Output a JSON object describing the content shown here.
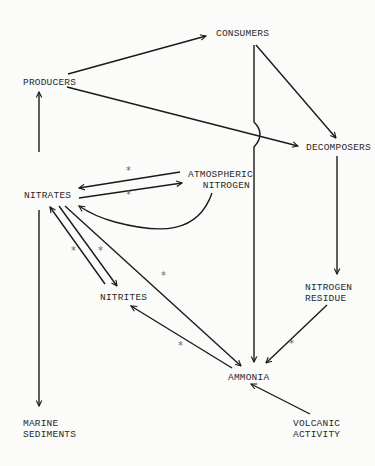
{
  "diagram": {
    "nodes": {
      "producers": "PRODUCERS",
      "consumers": "CONSUMERS",
      "decomposers": "DECOMPOSERS",
      "nitrates": "NITRATES",
      "atmospheric_nitrogen_line1": "ATMOSPHERIC",
      "atmospheric_nitrogen_line2": "NITROGEN",
      "nitrites": "NITRITES",
      "nitrogen_residue_line1": "NITROGEN",
      "nitrogen_residue_line2": "RESIDUE",
      "ammonia": "AMMONIA",
      "marine_sediments_line1": "MARINE",
      "marine_sediments_line2": "SEDIMENTS",
      "volcanic_activity_line1": "VOLCANIC",
      "volcanic_activity_line2": "ACTIVITY"
    },
    "marker": "*",
    "edges": [
      {
        "from": "PRODUCERS",
        "to": "CONSUMERS"
      },
      {
        "from": "PRODUCERS",
        "to": "DECOMPOSERS"
      },
      {
        "from": "CONSUMERS",
        "to": "DECOMPOSERS"
      },
      {
        "from": "CONSUMERS",
        "to": "AMMONIA"
      },
      {
        "from": "DECOMPOSERS",
        "to": "NITROGEN RESIDUE"
      },
      {
        "from": "NITROGEN RESIDUE",
        "to": "AMMONIA",
        "marked": true
      },
      {
        "from": "NITRATES",
        "to": "PRODUCERS"
      },
      {
        "from": "NITRATES",
        "to": "MARINE SEDIMENTS"
      },
      {
        "from": "NITRATES",
        "to": "ATMOSPHERIC NITROGEN",
        "marked": true
      },
      {
        "from": "ATMOSPHERIC NITROGEN",
        "to": "NITRATES",
        "marked": true
      },
      {
        "from": "ATMOSPHERIC NITROGEN",
        "to": "NITRATES",
        "curved": true
      },
      {
        "from": "NITRATES",
        "to": "NITRITES",
        "marked": true
      },
      {
        "from": "NITRITES",
        "to": "NITRATES",
        "marked": true
      },
      {
        "from": "NITRATES",
        "to": "AMMONIA",
        "marked": true
      },
      {
        "from": "AMMONIA",
        "to": "NITRITES",
        "marked": true
      },
      {
        "from": "VOLCANIC ACTIVITY",
        "to": "AMMONIA"
      }
    ]
  }
}
